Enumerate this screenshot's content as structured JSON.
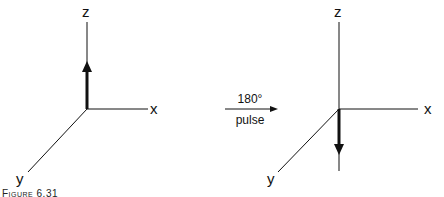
{
  "left_diagram": {
    "axes": {
      "z": "z",
      "x": "x",
      "y": "y"
    },
    "vector_direction": "up"
  },
  "transition": {
    "top_label": "180°",
    "bottom_label": "pulse"
  },
  "right_diagram": {
    "axes": {
      "z": "z",
      "x": "x",
      "y": "y"
    },
    "vector_direction": "down"
  },
  "caption": "Figure 6.31"
}
